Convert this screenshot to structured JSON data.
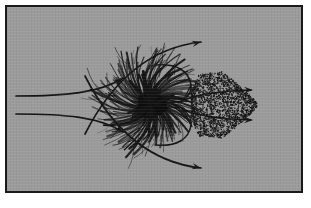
{
  "figure": {
    "caption": "",
    "frame": {
      "border_color": "#1a1a1a",
      "border_width_px": 2,
      "background_color": "#9b9b9b",
      "page_color": "#ffffff",
      "x": 5,
      "y": 5,
      "width": 298,
      "height": 188
    },
    "ink_color": "#141414"
  },
  "chart_data": {
    "type": "diagram",
    "xlabel": "",
    "ylabel": "",
    "grid": false,
    "legend_position": "none",
    "axis_ranges": {
      "x": [
        0,
        298
      ],
      "y": [
        0,
        188
      ]
    },
    "elements": [
      {
        "name": "inflow-streamline-upper",
        "type": "streamline",
        "description": "Horizontal inflow line entering from the left, curving upward toward the body shoulder, terminating in an arrowhead",
        "path": "M 11,91 C 60,91 95,88 118,73",
        "arrow_at": [
          118,
          73
        ],
        "arrow_angle_deg": -33
      },
      {
        "name": "inflow-streamline-lower",
        "type": "streamline",
        "description": "Horizontal inflow line entering from the left, curving downward toward the body shoulder, terminating in an arrowhead",
        "path": "M 11,109 C 60,109 95,112 118,127",
        "arrow_at": [
          118,
          127
        ],
        "arrow_angle_deg": 33
      },
      {
        "name": "outer-streamline-upper",
        "type": "streamline",
        "description": "Arc sweeping over the top of the burst body, terminating in an arrowhead pointing up and to the right",
        "path": "M 80,129 C 110,70 150,42 196,37",
        "arrow_at": [
          196,
          37
        ],
        "arrow_angle_deg": -12
      },
      {
        "name": "outer-streamline-lower",
        "type": "streamline",
        "description": "Arc sweeping under the bottom of the burst body, terminating in an arrowhead pointing down and to the right",
        "path": "M 80,71 C 110,130 150,158 196,163",
        "arrow_at": [
          196,
          163
        ],
        "arrow_angle_deg": 12
      },
      {
        "name": "wake-streamline-upper",
        "type": "streamline",
        "description": "Upper wake boundary running right from the body neck into the stippled wake, terminating in an arrowhead",
        "arrow_at": [
          248,
          85
        ],
        "arrow_angle_deg": 0
      },
      {
        "name": "wake-streamline-lower",
        "type": "streamline",
        "description": "Lower wake boundary running right from the body neck into the stippled wake, terminating in an arrowhead",
        "arrow_at": [
          248,
          115
        ],
        "arrow_angle_deg": 0
      },
      {
        "name": "radial-burst-body",
        "type": "radial-filament-cluster",
        "description": "Dense dandelion-like burst of curved radiating filaments around a solid dark core",
        "center": [
          146,
          100
        ],
        "core_radius_px": 13,
        "outer_radius_px": 52,
        "filament_count": 150,
        "spiral_twist_deg": 38
      },
      {
        "name": "body-neck-outline",
        "type": "outline",
        "description": "Curved outline enclosing the right side of the body forming a narrow neck with two inward cusps before the wake"
      },
      {
        "name": "turbulent-wake",
        "type": "stipple-field",
        "description": "Triangular stippled (dotted) turbulent wake widening from the neck then tapering to the right arrowheads",
        "x_range": [
          186,
          252
        ],
        "y_range": [
          68,
          132
        ],
        "dot_count": 2600,
        "dot_radius_px": 0.55
      }
    ]
  }
}
